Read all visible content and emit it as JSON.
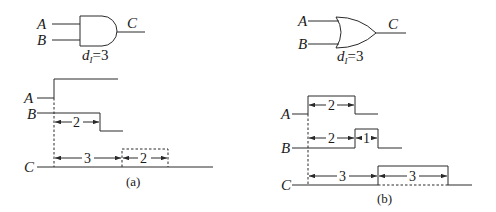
{
  "figure_a": {
    "gate_type": "AND",
    "inputs": [
      "A",
      "B"
    ],
    "output": "C",
    "delay_label": "d",
    "delay_sub": "I",
    "delay_value": "=3",
    "waveforms": {
      "A_label": "A",
      "B_label": "B",
      "C_label": "C"
    },
    "annotations": {
      "b_pulse_width": "2",
      "c_delay": "3",
      "c_pulse_width": "2"
    },
    "caption": "(a)"
  },
  "figure_b": {
    "gate_type": "OR",
    "inputs": [
      "A",
      "B"
    ],
    "output": "C",
    "delay_label": "d",
    "delay_sub": "I",
    "delay_value": "=3",
    "waveforms": {
      "A_label": "A",
      "B_label": "B",
      "C_label": "C"
    },
    "annotations": {
      "a_pulse_width": "2",
      "b_delay_to_rise": "2",
      "b_pulse_width": "1",
      "c_delay": "3",
      "c_pulse_width": "3"
    },
    "caption": "(b)"
  }
}
